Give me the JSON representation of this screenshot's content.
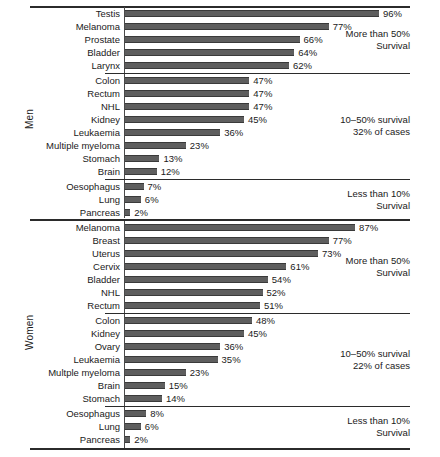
{
  "chart_data": {
    "type": "bar",
    "orientation": "horizontal",
    "title": "",
    "subtitle": "",
    "xlabel": "",
    "ylabel": "",
    "xlim": [
      0,
      100
    ],
    "grid": false,
    "legend": "none",
    "value_suffix": "%",
    "bar_color": "#5e5e5e",
    "axis_color": "#2b2b2b",
    "groups": [
      {
        "name": "Men",
        "label": "Men",
        "bands": [
          {
            "id": "men-high",
            "note_lines": [
              "More than 50%",
              "Survival"
            ],
            "rows": [
              {
                "category": "Testis",
                "value": 96,
                "label": "96%"
              },
              {
                "category": "Melanoma",
                "value": 77,
                "label": "77%"
              },
              {
                "category": "Prostate",
                "value": 66,
                "label": "66%"
              },
              {
                "category": "Bladder",
                "value": 64,
                "label": "64%"
              },
              {
                "category": "Larynx",
                "value": 62,
                "label": "62%"
              }
            ]
          },
          {
            "id": "men-mid",
            "note_lines": [
              "10–50% survival",
              "32% of cases"
            ],
            "rows": [
              {
                "category": "Colon",
                "value": 47,
                "label": "47%"
              },
              {
                "category": "Rectum",
                "value": 47,
                "label": "47%"
              },
              {
                "category": "NHL",
                "value": 47,
                "label": "47%"
              },
              {
                "category": "Kidney",
                "value": 45,
                "label": "45%"
              },
              {
                "category": "Leukaemia",
                "value": 36,
                "label": "36%"
              },
              {
                "category": "Multiple myeloma",
                "value": 23,
                "label": "23%"
              },
              {
                "category": "Stomach",
                "value": 13,
                "label": "13%"
              },
              {
                "category": "Brain",
                "value": 12,
                "label": "12%"
              }
            ]
          },
          {
            "id": "men-low",
            "note_lines": [
              "Less than 10%",
              "Survival"
            ],
            "rows": [
              {
                "category": "Oesophagus",
                "value": 7,
                "label": "7%"
              },
              {
                "category": "Lung",
                "value": 6,
                "label": "6%"
              },
              {
                "category": "Pancreas",
                "value": 2,
                "label": "2%"
              }
            ]
          }
        ]
      },
      {
        "name": "Women",
        "label": "Women",
        "bands": [
          {
            "id": "women-high",
            "note_lines": [
              "More than 50%",
              "Survival"
            ],
            "rows": [
              {
                "category": "Melanoma",
                "value": 87,
                "label": "87%"
              },
              {
                "category": "Breast",
                "value": 77,
                "label": "77%"
              },
              {
                "category": "Uterus",
                "value": 73,
                "label": "73%"
              },
              {
                "category": "Cervix",
                "value": 61,
                "label": "61%"
              },
              {
                "category": "Bladder",
                "value": 54,
                "label": "54%"
              },
              {
                "category": "NHL",
                "value": 52,
                "label": "52%"
              },
              {
                "category": "Rectum",
                "value": 51,
                "label": "51%"
              }
            ]
          },
          {
            "id": "women-mid",
            "note_lines": [
              "10–50% survival",
              "22% of cases"
            ],
            "rows": [
              {
                "category": "Colon",
                "value": 48,
                "label": "48%"
              },
              {
                "category": "Kidney",
                "value": 45,
                "label": "45%"
              },
              {
                "category": "Ovary",
                "value": 36,
                "label": "36%"
              },
              {
                "category": "Leukaemia",
                "value": 35,
                "label": "35%"
              },
              {
                "category": "Multple myeloma",
                "value": 23,
                "label": "23%"
              },
              {
                "category": "Brain",
                "value": 15,
                "label": "15%"
              },
              {
                "category": "Stomach",
                "value": 14,
                "label": "14%"
              }
            ]
          },
          {
            "id": "women-low",
            "note_lines": [
              "Less than 10%",
              "Survival"
            ],
            "rows": [
              {
                "category": "Oesophagus",
                "value": 8,
                "label": "8%"
              },
              {
                "category": "Lung",
                "value": 6,
                "label": "6%"
              },
              {
                "category": "Pancreas",
                "value": 2,
                "label": "2%"
              }
            ]
          }
        ]
      }
    ]
  }
}
